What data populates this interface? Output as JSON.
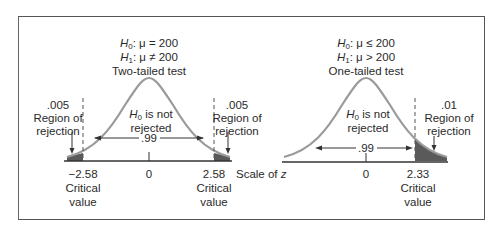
{
  "left": {
    "h0": "μ = 200",
    "h1": "μ ≠ 200",
    "test": "Two-tailed test",
    "center_label_1": "is not",
    "center_label_2": "rejected",
    "left_alpha": ".005",
    "right_alpha": ".005",
    "region_1": "Region of",
    "region_2": "rejection",
    "middle_area": ".99",
    "left_crit": "−2.58",
    "right_crit": "2.58",
    "zero": "0",
    "crit_1": "Critical",
    "crit_2": "value"
  },
  "right": {
    "h0": "μ ≤ 200",
    "h1": "μ > 200",
    "test": "One-tailed test",
    "center_label_1": "is not",
    "center_label_2": "rejected",
    "right_alpha": ".01",
    "region_1": "Region of",
    "region_2": "rejection",
    "middle_area": ".99",
    "right_crit": "2.33",
    "zero": "0",
    "crit_1": "Critical",
    "crit_2": "value"
  },
  "scale_label": "Scale of",
  "scale_var": "z",
  "H": "H",
  "sub0": "0",
  "sub1": "1",
  "colors": {
    "curve": "#9a9a9a",
    "shade": "#5a5a5a",
    "axis": "#333333"
  }
}
